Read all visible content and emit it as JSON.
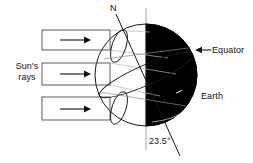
{
  "diagram": {
    "labels": {
      "suns_rays": "Sun's\nrays",
      "north_pole": "N",
      "equator": "Equator",
      "earth": "Earth",
      "tilt_angle": "23.5°"
    },
    "colors": {
      "night_side": "#000000",
      "day_side": "#ffffff",
      "outline": "#1a1a1a",
      "guide_line": "#8c8c8c",
      "text": "#111111",
      "background": "#ffffff"
    },
    "earth": {
      "center_x": 146,
      "center_y": 75,
      "radius": 51,
      "terminator_x": 146,
      "axis_tilt_degrees": 23.5
    },
    "sun_rays": [
      {
        "label": "top-ray",
        "x": 42,
        "y": 30,
        "width": 68,
        "height": 20,
        "arrow_direction": "right"
      },
      {
        "label": "middle-ray",
        "x": 42,
        "y": 63,
        "width": 68,
        "height": 22,
        "arrow_direction": "right"
      },
      {
        "label": "bottom-ray",
        "x": 42,
        "y": 97,
        "width": 68,
        "height": 23,
        "arrow_direction": "right"
      }
    ],
    "equator_pointer": {
      "direction": "left",
      "from_x": 210,
      "to_x": 196,
      "y": 50
    }
  }
}
